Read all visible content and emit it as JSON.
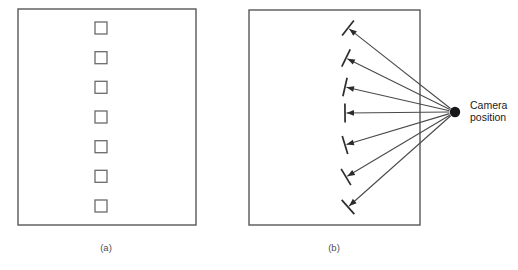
{
  "figure": {
    "width": 518,
    "height": 270,
    "background": "#ffffff",
    "line_color": "#58585a",
    "ink_color": "#2b2b2d",
    "camera_dot_color": "#17171a"
  },
  "panel_a": {
    "caption": "(a)",
    "caption_x": 106,
    "caption_y": 251,
    "frame": {
      "x": 18,
      "y": 9,
      "width": 178,
      "height": 216
    },
    "squares_label": "surface-patches-frontoparallel",
    "square_size": 12,
    "squares": [
      {
        "cx": 101,
        "cy": 28
      },
      {
        "cx": 101,
        "cy": 57.7
      },
      {
        "cx": 101,
        "cy": 87.3
      },
      {
        "cx": 101,
        "cy": 117
      },
      {
        "cx": 101,
        "cy": 146.7
      },
      {
        "cx": 101,
        "cy": 176.3
      },
      {
        "cx": 101,
        "cy": 206
      }
    ]
  },
  "panel_b": {
    "caption": "(b)",
    "caption_x": 334,
    "caption_y": 251,
    "frame": {
      "x": 249,
      "y": 10,
      "width": 171,
      "height": 215
    },
    "camera": {
      "label_line_1": "Camera",
      "label_line_2": "position",
      "label_x": 470,
      "label_y_1": 109,
      "label_y_2": 121,
      "dot_cx": 455,
      "dot_cy": 112,
      "dot_r": 5.2
    },
    "tick_length": 19,
    "rays_label": "viewing-rays-to-oriented-patches",
    "rays": [
      {
        "tx": 348,
        "ty": 28
      },
      {
        "tx": 346,
        "ty": 58
      },
      {
        "tx": 345,
        "ty": 87
      },
      {
        "tx": 345,
        "ty": 113
      },
      {
        "tx": 345,
        "ty": 145
      },
      {
        "tx": 346,
        "ty": 177
      },
      {
        "tx": 348,
        "ty": 207
      }
    ]
  }
}
